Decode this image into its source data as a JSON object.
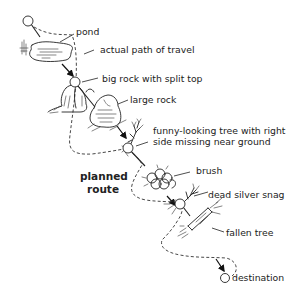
{
  "diagram": {
    "type": "navigation-sketch",
    "labels": {
      "pond": "pond",
      "actual_path": "actual path of travel",
      "big_rock": "big rock with split top",
      "large_rock": "large rock",
      "funny_tree_line1": "funny-looking tree with right",
      "funny_tree_line2": "side missing near ground",
      "brush": "brush",
      "planned_route_line1": "planned",
      "planned_route_line2": "route",
      "dead_snag": "dead silver snag",
      "fallen_tree": "fallen tree",
      "destination": "destination"
    },
    "landmarks": [
      {
        "id": "start",
        "icon": "start-waypoint-circle"
      },
      {
        "id": "pond",
        "icon": "pond-icon"
      },
      {
        "id": "big_rock",
        "icon": "split-rock-icon"
      },
      {
        "id": "large_rock",
        "icon": "large-rock-icon"
      },
      {
        "id": "funny_tree",
        "icon": "tree-icon"
      },
      {
        "id": "brush",
        "icon": "brush-icon"
      },
      {
        "id": "dead_snag",
        "icon": "snag-icon"
      },
      {
        "id": "fallen_tree",
        "icon": "fallen-tree-icon"
      },
      {
        "id": "destination",
        "icon": "destination-waypoint-circle"
      }
    ],
    "legend": {
      "solid_line": "planned route",
      "dashed_line": "actual path of travel"
    },
    "colors": {
      "ink": "#222222",
      "background": "#ffffff"
    }
  }
}
